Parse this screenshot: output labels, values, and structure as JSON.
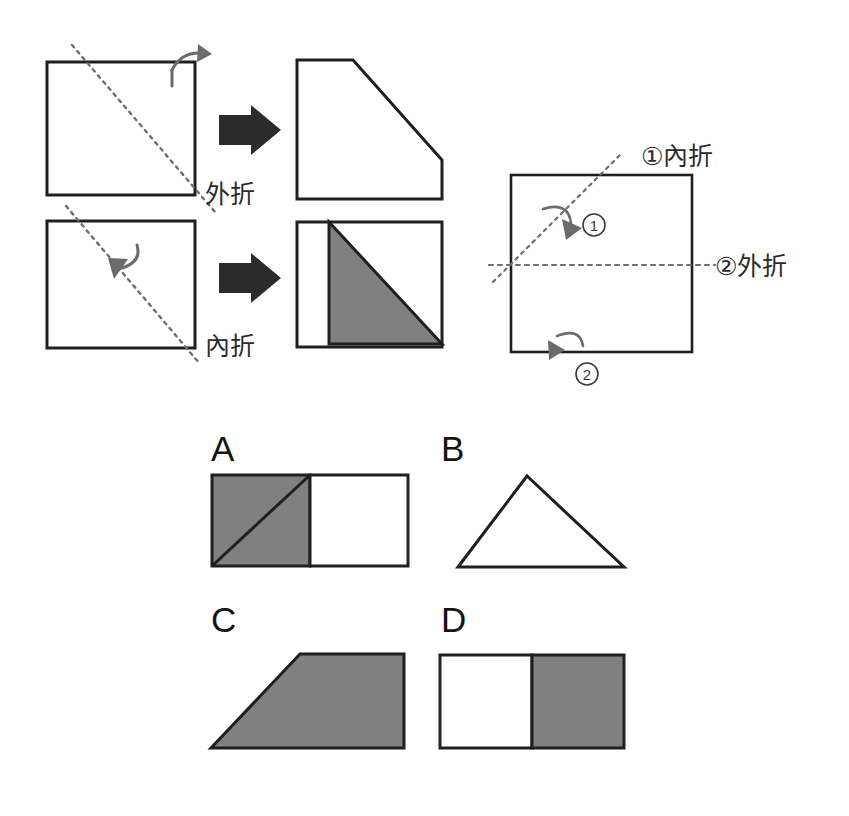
{
  "page": {
    "background": "#ffffff",
    "width": 849,
    "height": 816
  },
  "colors": {
    "stroke": "#1f1f1f",
    "shaded": "#808080",
    "shaded_stroke": "#1f1f1f",
    "paper": "#ffffff",
    "fold_line": "#6e6e6e",
    "curve_arrow": "#6b6b6b",
    "block_arrow": "#2b2b2b",
    "text": "#1a1a1a"
  },
  "legend": {
    "name": "fold-type-legend",
    "rows": [
      {
        "id": "outer-fold",
        "label": "外折",
        "label_meaning": "outer-fold",
        "before": {
          "shape": "square",
          "fold_line": "diagonal-down-right",
          "fold_line_style": "dotted"
        },
        "arrow": "block-arrow-right",
        "curve_arrow": {
          "direction": "over-corner-outward",
          "points": "right-down"
        },
        "after": {
          "shape": "pentagon-corner-cut",
          "fill": "white",
          "description": "square with top-left to right-lower diagonal cut, white"
        }
      },
      {
        "id": "inner-fold",
        "label": "內折",
        "label_meaning": "inner-fold",
        "before": {
          "shape": "square",
          "fold_line": "diagonal-down-right",
          "fold_line_style": "dotted"
        },
        "arrow": "block-arrow-right",
        "curve_arrow": {
          "direction": "over-crease-inward",
          "points": "down-left"
        },
        "after": {
          "shape": "square-with-shaded-triangle",
          "fill": "white-with-gray-flap",
          "description": "square outline with gray folded triangle flap inside upper right"
        }
      }
    ]
  },
  "problem": {
    "name": "fold-sequence-diagram",
    "sheet": {
      "shape": "square"
    },
    "folds": [
      {
        "number": "1",
        "circled": "①",
        "label": "①內折",
        "label_text": "內折",
        "type": "inner-fold",
        "crease": "diagonal-rising",
        "crease_style": "dotted",
        "arrow_direction": "down-right-inward"
      },
      {
        "number": "2",
        "circled": "②",
        "label": "②外折",
        "label_text": "外折",
        "type": "outer-fold",
        "crease": "horizontal-midline",
        "crease_style": "dotted",
        "arrow_direction": "down-outward"
      }
    ]
  },
  "options": {
    "name": "answer-options",
    "items": [
      {
        "letter": "A",
        "shape": "rectangle-half-shaded-with-diagonal",
        "description": "Wide rectangle: left half gray with diagonal line from bottom-left to top-right, right half white.",
        "left_half_fill": "#808080",
        "right_half_fill": "#ffffff",
        "has_diagonal": true
      },
      {
        "letter": "B",
        "shape": "triangle-outline",
        "description": "White outlined triangle, apex slightly right of centre.",
        "fill": "#ffffff",
        "has_diagonal": false
      },
      {
        "letter": "C",
        "shape": "trapezoid-shaded",
        "description": "Gray filled trapezoid, slanted left edge rising to the right.",
        "fill": "#808080",
        "has_diagonal": false
      },
      {
        "letter": "D",
        "shape": "rectangle-right-half-shaded",
        "description": "Wide rectangle: left half white, right half gray.",
        "left_half_fill": "#ffffff",
        "right_half_fill": "#808080",
        "has_diagonal": false
      }
    ]
  }
}
